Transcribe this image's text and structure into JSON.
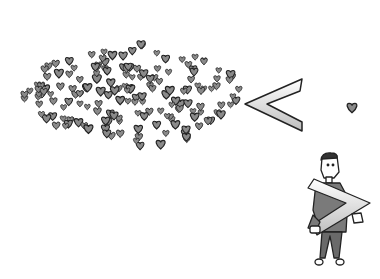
{
  "illustration": {
    "description": "Cartoon: a large cloud of many small hearts beside a less-than sign, a single small heart on the right, and a man carrying a greater-than sign",
    "colors": {
      "background": "#ffffff",
      "heart_fill": "#8a8a8a",
      "outline": "#222222",
      "shirt": "#7a7a7a",
      "pants": "#6a6a6a",
      "skin": "#ffffff"
    },
    "elements": [
      {
        "name": "heart-cloud",
        "shape": "many-hearts"
      },
      {
        "name": "less-than-sign",
        "glyph": "<"
      },
      {
        "name": "single-heart",
        "shape": "heart"
      },
      {
        "name": "man-carrying-sign",
        "glyph": ">"
      }
    ]
  }
}
